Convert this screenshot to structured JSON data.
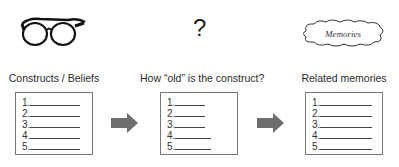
{
  "columns": [
    {
      "icon": "glasses-icon",
      "label": "Constructs / Beliefs",
      "items": [
        "1.",
        "2.",
        "3.",
        "4.",
        "5."
      ]
    },
    {
      "icon": "question-mark-icon",
      "icon_text": "?",
      "label": "How “old” is the construct?",
      "items": [
        "1.",
        "2.",
        "3.",
        "4.",
        "5."
      ]
    },
    {
      "icon": "cloud-icon",
      "icon_text": "Memories",
      "label": "Related memories",
      "items": [
        "1.",
        "2.",
        "3.",
        "4.",
        "5."
      ]
    }
  ],
  "arrows": [
    "right-arrow",
    "right-arrow"
  ],
  "colors": {
    "arrow": "#6e6e6e",
    "box_border": "#777777",
    "text": "#2a2a2a"
  }
}
